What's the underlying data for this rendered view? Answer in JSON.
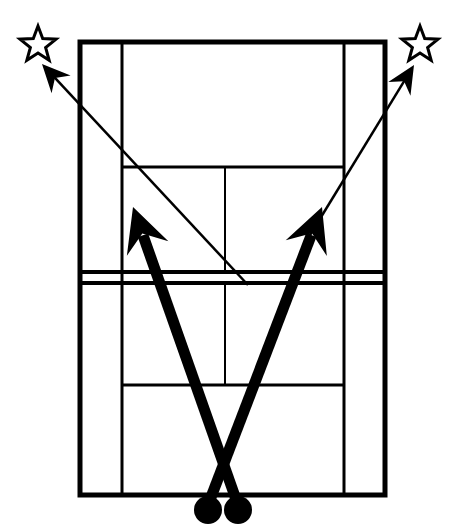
{
  "diagram": {
    "type": "sports-court-play-diagram",
    "sport": "tennis",
    "view": "overhead-top-down",
    "background_color": "#ffffff",
    "line_color": "#000000",
    "canvas": {
      "width": 450,
      "height": 532
    }
  },
  "court": {
    "name": "tennis-court",
    "outer_doubles_rect": {
      "x": 80,
      "y": 42,
      "width": 305,
      "height": 453
    },
    "singles_sideline_left_x": 122,
    "singles_sideline_right_x": 344,
    "baseline_far_y": 42,
    "baseline_near_y": 495,
    "service_line_far_y": 167,
    "service_line_near_y": 385,
    "center_service_line_x": 225,
    "net": {
      "name": "net",
      "top_line_y": 272,
      "bottom_line_y": 283,
      "x_start": 80,
      "x_end": 385
    },
    "outer_line_width": 5,
    "inner_line_width": 3,
    "net_line_width": 4,
    "center_line_width": 2
  },
  "players": [
    {
      "name": "player-left",
      "label": "",
      "shape": "filled-circle",
      "cx": 208,
      "cy": 510,
      "r": 14,
      "color": "#000000"
    },
    {
      "name": "player-right",
      "label": "",
      "shape": "filled-circle",
      "cx": 238,
      "cy": 510,
      "r": 14,
      "color": "#000000"
    }
  ],
  "targets": [
    {
      "name": "target-star-left",
      "shape": "star-outline",
      "cx": 38,
      "cy": 45,
      "outer_r": 19,
      "inner_r": 8,
      "color": "#000000",
      "fill": "#ffffff",
      "stroke_width": 3
    },
    {
      "name": "target-star-right",
      "shape": "star-outline",
      "cx": 420,
      "cy": 45,
      "outer_r": 19,
      "inner_r": 8,
      "color": "#000000",
      "fill": "#ffffff",
      "stroke_width": 3
    }
  ],
  "movement_arrows": [
    {
      "name": "movement-arrow-left-player",
      "description": "thick arrow from left player crossing court to left-center forecourt",
      "style": "thick-solid",
      "from": {
        "x": 238,
        "y": 505
      },
      "to": {
        "x": 133,
        "y": 207
      },
      "line_width": 11,
      "arrowhead": "solid-triangle",
      "color": "#000000"
    },
    {
      "name": "movement-arrow-right-player",
      "description": "thick arrow from right player crossing court to right-center forecourt",
      "style": "thick-solid",
      "from": {
        "x": 208,
        "y": 505
      },
      "to": {
        "x": 322,
        "y": 207
      },
      "line_width": 11,
      "arrowhead": "solid-triangle",
      "color": "#000000"
    }
  ],
  "ball_arrows": [
    {
      "name": "ball-arrow-left",
      "description": "thin arrow from right-of-center baseline area out to the left star target",
      "style": "thin-solid",
      "from": {
        "x": 248,
        "y": 285
      },
      "to": {
        "x": 42,
        "y": 64
      },
      "line_width": 2.5,
      "arrowhead": "solid-triangle",
      "color": "#000000"
    },
    {
      "name": "ball-arrow-right",
      "description": "thin arrow from left-of-center baseline area out to the right star target",
      "style": "thin-solid",
      "from": {
        "x": 307,
        "y": 240
      },
      "to": {
        "x": 414,
        "y": 65
      },
      "line_width": 2.5,
      "arrowhead": "solid-triangle",
      "color": "#000000"
    }
  ]
}
